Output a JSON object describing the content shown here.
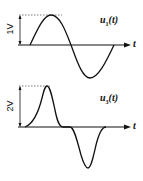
{
  "diagram": {
    "top_plot": {
      "signal_label": "u",
      "signal_subscript": "1",
      "signal_arg": "(t)",
      "amplitude_label": "1V",
      "axis_label": "t",
      "waveform": "sine"
    },
    "bottom_plot": {
      "signal_label": "u",
      "signal_subscript": "3",
      "signal_arg": "(t)",
      "amplitude_label": "2V",
      "axis_label": "t",
      "waveform": "positive pulse followed by negative pulse"
    },
    "colors": {
      "line": "#111111",
      "dotted": "#555555"
    }
  }
}
